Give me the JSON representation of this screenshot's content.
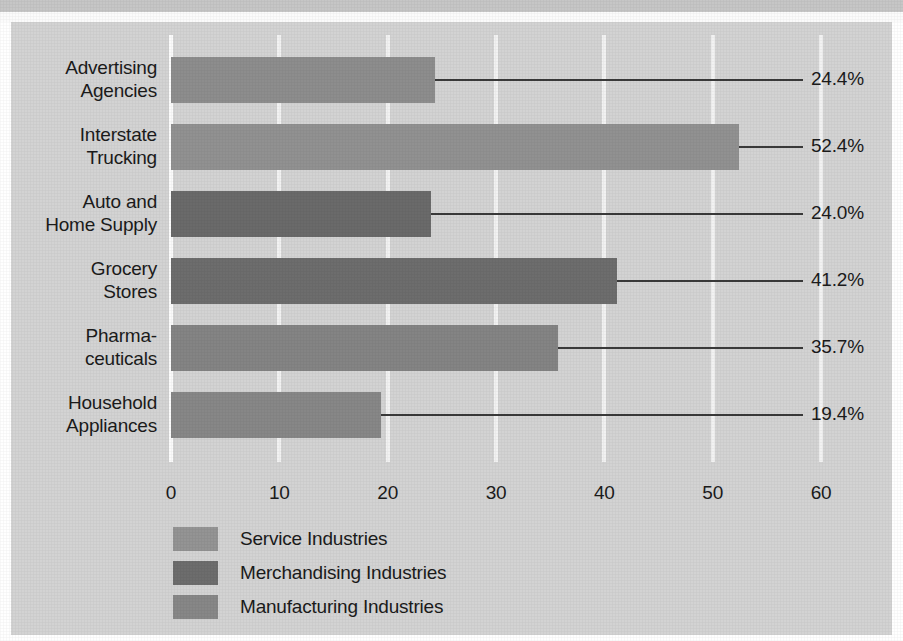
{
  "chart_data": {
    "type": "bar",
    "orientation": "horizontal",
    "title": "",
    "xlabel": "",
    "ylabel": "",
    "xlim": [
      0,
      60
    ],
    "xticks": [
      "0",
      "10",
      "20",
      "30",
      "40",
      "50",
      "60"
    ],
    "grid": true,
    "legend_position": "bottom-left",
    "categories": [
      "Advertising Agencies",
      "Interstate Trucking",
      "Auto and Home Supply",
      "Grocery Stores",
      "Pharmaceuticals",
      "Household Appliances"
    ],
    "values": [
      24.4,
      52.4,
      24.0,
      41.2,
      35.7,
      19.4
    ],
    "value_labels": [
      "24.4%",
      "52.4%",
      "24.0%",
      "41.2%",
      "35.7%",
      "19.4%"
    ],
    "bars": [
      {
        "label_line1": "Advertising",
        "label_line2": "Agencies",
        "value": 24.4,
        "value_label": "24.4%",
        "group": "Service Industries",
        "color": "#8d8d8d"
      },
      {
        "label_line1": "Interstate",
        "label_line2": "Trucking",
        "value": 52.4,
        "value_label": "52.4%",
        "group": "Service Industries",
        "color": "#919191"
      },
      {
        "label_line1": "Auto and",
        "label_line2": "Home Supply",
        "value": 24.0,
        "value_label": "24.0%",
        "group": "Merchandising Industries",
        "color": "#6a6a6a"
      },
      {
        "label_line1": "Grocery",
        "label_line2": "Stores",
        "value": 41.2,
        "value_label": "41.2%",
        "group": "Merchandising Industries",
        "color": "#6d6d6d"
      },
      {
        "label_line1": "Pharma-",
        "label_line2": "ceuticals",
        "value": 35.7,
        "value_label": "35.7%",
        "group": "Manufacturing Industries",
        "color": "#848484"
      },
      {
        "label_line1": "Household",
        "label_line2": "Appliances",
        "value": 19.4,
        "value_label": "19.4%",
        "group": "Manufacturing Industries",
        "color": "#878787"
      }
    ],
    "legend": [
      {
        "label": "Service Industries",
        "color": "#949494"
      },
      {
        "label": "Merchandising Industries",
        "color": "#6d6d6d"
      },
      {
        "label": "Manufacturing Industries",
        "color": "#878787"
      }
    ],
    "colors": {
      "background": "#d3d3d3",
      "gridline": "#f2f2f2",
      "text": "#1b1b1b",
      "leader_line": "#3a3a3a"
    }
  }
}
